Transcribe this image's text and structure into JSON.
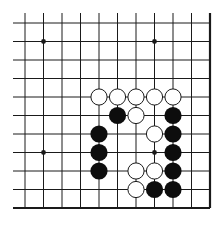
{
  "board": {
    "title": "Go problem diagram",
    "columns": 11,
    "rows": 11,
    "open_edges": [
      "top",
      "left"
    ],
    "closed_edges": [
      "bottom",
      "right"
    ],
    "colors": {
      "background": "#ffffff",
      "line": "#1a1a1a",
      "black_stone": "#0d0d0d",
      "white_stone": "#ffffff",
      "white_stone_outline": "#1a1a1a"
    },
    "hoshi": [
      {
        "col": 1,
        "row": 1
      },
      {
        "col": 7,
        "row": 1
      },
      {
        "col": 1,
        "row": 7
      },
      {
        "col": 7,
        "row": 7
      }
    ],
    "stones": [
      {
        "color": "white",
        "col": 4,
        "row": 4
      },
      {
        "color": "white",
        "col": 5,
        "row": 4
      },
      {
        "color": "white",
        "col": 6,
        "row": 4
      },
      {
        "color": "white",
        "col": 7,
        "row": 4
      },
      {
        "color": "white",
        "col": 8,
        "row": 4
      },
      {
        "color": "black",
        "col": 5,
        "row": 5
      },
      {
        "color": "white",
        "col": 6,
        "row": 5
      },
      {
        "color": "black",
        "col": 8,
        "row": 5
      },
      {
        "color": "black",
        "col": 4,
        "row": 6
      },
      {
        "color": "white",
        "col": 7,
        "row": 6
      },
      {
        "color": "black",
        "col": 8,
        "row": 6
      },
      {
        "color": "black",
        "col": 4,
        "row": 7
      },
      {
        "color": "black",
        "col": 8,
        "row": 7
      },
      {
        "color": "black",
        "col": 4,
        "row": 8
      },
      {
        "color": "white",
        "col": 6,
        "row": 8
      },
      {
        "color": "white",
        "col": 7,
        "row": 8
      },
      {
        "color": "black",
        "col": 8,
        "row": 8
      },
      {
        "color": "white",
        "col": 6,
        "row": 9
      },
      {
        "color": "black",
        "col": 7,
        "row": 9
      },
      {
        "color": "black",
        "col": 8,
        "row": 9
      }
    ]
  }
}
